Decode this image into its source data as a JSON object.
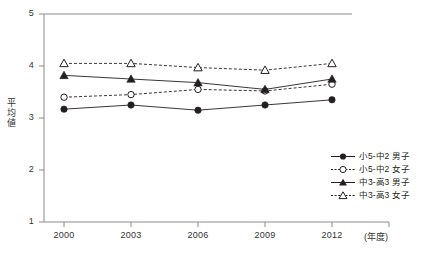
{
  "chart_data": {
    "type": "line",
    "title": "",
    "xlabel": "(年度)",
    "ylabel": "平均値",
    "categories": [
      "2000",
      "2003",
      "2006",
      "2009",
      "2012"
    ],
    "x_unit_label": "(年度)",
    "ylim": [
      1,
      5
    ],
    "yticks": [
      "1",
      "2",
      "3",
      "4",
      "5"
    ],
    "grid": false,
    "legend_position": "bottom-right",
    "series": [
      {
        "name": "小5-中2 男子",
        "marker": "filled-circle",
        "line": "solid",
        "color": "#231f20",
        "values": [
          3.17,
          3.25,
          3.15,
          3.25,
          3.35
        ]
      },
      {
        "name": "小5-中2 女子",
        "marker": "open-circle",
        "line": "dashed",
        "color": "#231f20",
        "values": [
          3.4,
          3.45,
          3.55,
          3.52,
          3.65
        ]
      },
      {
        "name": "中3-高3 男子",
        "marker": "filled-triangle",
        "line": "solid",
        "color": "#231f20",
        "values": [
          3.82,
          3.75,
          3.68,
          3.55,
          3.75
        ]
      },
      {
        "name": "中3-高3 女子",
        "marker": "open-triangle",
        "line": "dashed",
        "color": "#231f20",
        "values": [
          4.05,
          4.05,
          3.97,
          3.92,
          4.05
        ]
      }
    ]
  },
  "axis": {
    "y_title": "平均値",
    "y_title_chars": [
      "平",
      "均",
      "値"
    ],
    "y_ticks": [
      "5",
      "4",
      "3",
      "2",
      "1"
    ],
    "x_ticks": [
      "2000",
      "2003",
      "2006",
      "2009",
      "2012"
    ],
    "x_unit": "(年度)"
  },
  "legend": {
    "items": [
      {
        "label": "小5-中2 男子"
      },
      {
        "label": "小5-中2 女子"
      },
      {
        "label": "中3-高3 男子"
      },
      {
        "label": "中3-高3 女子"
      }
    ]
  }
}
